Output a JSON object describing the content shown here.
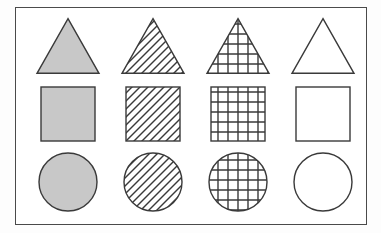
{
  "figure": {
    "frame": {
      "border_color": "#4a4a4a",
      "background_color": "#ffffff",
      "x": 15,
      "y": 7,
      "width": 352,
      "height": 218
    },
    "page_background": "#fdfdfd"
  },
  "palette": {
    "outline": "#3a3a3a",
    "solid_fill": "#c8c8c8",
    "hatch_line": "#3a3a3a",
    "grid_line": "#3a3a3a",
    "empty_fill": "#ffffff"
  },
  "rows": [
    {
      "id": "row-triangles",
      "shape": "triangle",
      "label": "Triangle"
    },
    {
      "id": "row-squares",
      "shape": "square",
      "label": "Square"
    },
    {
      "id": "row-circles",
      "shape": "circle",
      "label": "Circle"
    }
  ],
  "columns": [
    {
      "id": "col-solid",
      "fill": "solid",
      "label": "Solid gray"
    },
    {
      "id": "col-hatch",
      "fill": "hatch",
      "label": "Diagonal hatch"
    },
    {
      "id": "col-grid",
      "fill": "grid",
      "label": "Cross-hatch grid"
    },
    {
      "id": "col-empty",
      "fill": "empty",
      "label": "Empty outline"
    }
  ],
  "geometry": {
    "col_x": [
      12,
      97,
      182,
      267
    ],
    "row_y": [
      6,
      74,
      142
    ],
    "cell_width": 80,
    "cell_height": 64,
    "triangle_size": 62,
    "square_size": 54,
    "circle_diameter": 58,
    "hatch_spacing": 8,
    "hatch_angle_deg": 45,
    "grid_spacing": 10,
    "stroke_width": 1.4
  },
  "cells": [
    {
      "name": "triangle-solid",
      "shape": "triangle",
      "fill": "solid",
      "row": 0,
      "col": 0
    },
    {
      "name": "triangle-hatch",
      "shape": "triangle",
      "fill": "hatch",
      "row": 0,
      "col": 1
    },
    {
      "name": "triangle-grid",
      "shape": "triangle",
      "fill": "grid",
      "row": 0,
      "col": 2
    },
    {
      "name": "triangle-empty",
      "shape": "triangle",
      "fill": "empty",
      "row": 0,
      "col": 3
    },
    {
      "name": "square-solid",
      "shape": "square",
      "fill": "solid",
      "row": 1,
      "col": 0
    },
    {
      "name": "square-hatch",
      "shape": "square",
      "fill": "hatch",
      "row": 1,
      "col": 1
    },
    {
      "name": "square-grid",
      "shape": "square",
      "fill": "grid",
      "row": 1,
      "col": 2
    },
    {
      "name": "square-empty",
      "shape": "square",
      "fill": "empty",
      "row": 1,
      "col": 3
    },
    {
      "name": "circle-solid",
      "shape": "circle",
      "fill": "solid",
      "row": 2,
      "col": 0
    },
    {
      "name": "circle-hatch",
      "shape": "circle",
      "fill": "hatch",
      "row": 2,
      "col": 1
    },
    {
      "name": "circle-grid",
      "shape": "circle",
      "fill": "grid",
      "row": 2,
      "col": 2
    },
    {
      "name": "circle-empty",
      "shape": "circle",
      "fill": "empty",
      "row": 2,
      "col": 3
    }
  ]
}
